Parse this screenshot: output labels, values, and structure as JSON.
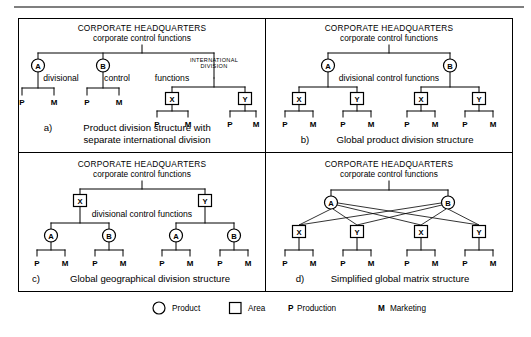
{
  "figure": {
    "headquarters_title": "CORPORATE HEADQUARTERS",
    "headquarters_subtitle": "corporate control functions",
    "panels": [
      {
        "id": "a",
        "caption_marker": "a)",
        "caption_line1": "Product division structure with",
        "caption_line2": "separate international division",
        "annotations": {
          "divisional": "divisional",
          "control": "control",
          "functions": "functions",
          "international_line1": "INTERNATIONAL",
          "international_line2": "DIVISION"
        },
        "level1": [
          {
            "label": "A",
            "shape": "circle"
          },
          {
            "label": "B",
            "shape": "circle"
          },
          {
            "label": "",
            "shape": "none"
          }
        ],
        "level2": [
          {
            "label": "X",
            "shape": "square"
          },
          {
            "label": "Y",
            "shape": "square"
          }
        ],
        "leaves": [
          "P",
          "M",
          "P",
          "M",
          "P",
          "M",
          "P",
          "M"
        ]
      },
      {
        "id": "b",
        "caption_marker": "b)",
        "caption_line1": "Global product division structure",
        "caption_line2": "",
        "annotations": {
          "divisional_control": "divisional control functions"
        },
        "level1": [
          {
            "label": "A",
            "shape": "circle"
          },
          {
            "label": "B",
            "shape": "circle"
          }
        ],
        "level2": [
          {
            "label": "X",
            "shape": "square"
          },
          {
            "label": "Y",
            "shape": "square"
          },
          {
            "label": "X",
            "shape": "square"
          },
          {
            "label": "Y",
            "shape": "square"
          }
        ],
        "leaves": [
          "P",
          "M",
          "P",
          "M",
          "P",
          "M",
          "P",
          "M"
        ]
      },
      {
        "id": "c",
        "caption_marker": "c)",
        "caption_line1": "Global geographical division structure",
        "caption_line2": "",
        "annotations": {
          "divisional_control": "divisional control functions"
        },
        "level1": [
          {
            "label": "X",
            "shape": "square"
          },
          {
            "label": "Y",
            "shape": "square"
          }
        ],
        "level2": [
          {
            "label": "A",
            "shape": "circle"
          },
          {
            "label": "B",
            "shape": "circle"
          },
          {
            "label": "A",
            "shape": "circle"
          },
          {
            "label": "B",
            "shape": "circle"
          }
        ],
        "leaves": [
          "P",
          "M",
          "P",
          "M",
          "P",
          "M",
          "P",
          "M"
        ]
      },
      {
        "id": "d",
        "caption_marker": "d)",
        "caption_line1": "Simplified global matrix structure",
        "caption_line2": "",
        "annotations": {},
        "level1": [
          {
            "label": "A",
            "shape": "circle"
          },
          {
            "label": "B",
            "shape": "circle"
          }
        ],
        "level2": [
          {
            "label": "X",
            "shape": "square"
          },
          {
            "label": "Y",
            "shape": "square"
          },
          {
            "label": "X",
            "shape": "square"
          },
          {
            "label": "Y",
            "shape": "square"
          }
        ],
        "leaves": [
          "P",
          "M",
          "P",
          "M",
          "P",
          "M",
          "P",
          "M"
        ]
      }
    ],
    "legend": [
      {
        "marker": "circle",
        "label": "Product"
      },
      {
        "marker": "square",
        "label": "Area"
      },
      {
        "marker": "P",
        "label": "Production"
      },
      {
        "marker": "M",
        "label": "Marketing"
      }
    ]
  }
}
